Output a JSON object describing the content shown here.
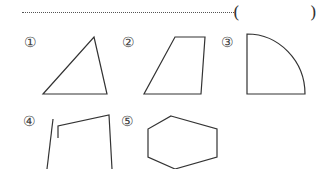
{
  "question": {
    "answer_open_paren": "(",
    "answer_close_paren": ")",
    "answer_value": ""
  },
  "options": [
    {
      "label": "①",
      "shape": "triangle"
    },
    {
      "label": "②",
      "shape": "trapezoid"
    },
    {
      "label": "③",
      "shape": "quarter-circle"
    },
    {
      "label": "④",
      "shape": "open-figure"
    },
    {
      "label": "⑤",
      "shape": "hexagon"
    }
  ],
  "colors": {
    "stroke": "#333333",
    "background": "#ffffff"
  }
}
